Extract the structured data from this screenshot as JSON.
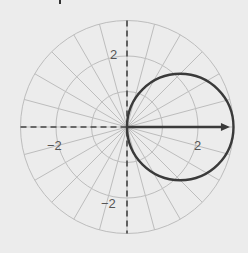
{
  "chart_data": {
    "type": "line",
    "subtype": "polar",
    "title": "",
    "xlabel": "",
    "ylabel": "",
    "polar_grid": {
      "radii": [
        1,
        2,
        3
      ],
      "spoke_step_deg": 15,
      "grid": true
    },
    "axes": {
      "x_range": [
        -3,
        3
      ],
      "y_range": [
        -3,
        3
      ],
      "style": "dashed"
    },
    "tick_labels": [
      {
        "text": "2",
        "x": 0,
        "y": 2,
        "position": "left of vertical axis"
      },
      {
        "text": "−2",
        "x": -2,
        "y": 0,
        "position": "below horizontal axis"
      },
      {
        "text": "2",
        "x": 2,
        "y": 0,
        "position": "below horizontal axis"
      },
      {
        "text": "−2",
        "x": 0,
        "y": -2,
        "position": "left of vertical axis"
      }
    ],
    "series": [
      {
        "name": "r = 3 cos θ",
        "kind": "circle",
        "center": [
          1.5,
          0
        ],
        "radius": 1.5,
        "points_r_theta": [
          {
            "theta_deg": 0,
            "r": 3
          },
          {
            "theta_deg": 30,
            "r": 2.6
          },
          {
            "theta_deg": 45,
            "r": 2.12
          },
          {
            "theta_deg": 60,
            "r": 1.5
          },
          {
            "theta_deg": 90,
            "r": 0
          },
          {
            "theta_deg": -30,
            "r": 2.6
          },
          {
            "theta_deg": -45,
            "r": 2.12
          },
          {
            "theta_deg": -60,
            "r": 1.5
          }
        ]
      },
      {
        "name": "vector",
        "kind": "arrow",
        "from": [
          0,
          0
        ],
        "to": [
          2.9,
          0
        ]
      }
    ],
    "colors": {
      "background": "#ececec",
      "grid": "#bdbdbd",
      "axis": "#444444",
      "curve": "#3a3a3a",
      "arrow": "#3a3a3a",
      "label": "#555555"
    }
  },
  "labels": {
    "y_pos": "2",
    "x_neg": "−2",
    "x_pos": "2",
    "y_neg": "−2"
  }
}
